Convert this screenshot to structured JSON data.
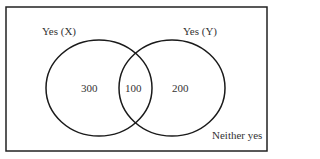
{
  "diagram": {
    "type": "venn",
    "sets": [
      {
        "label": "Yes (X)",
        "only_value": "300"
      },
      {
        "label": "Yes (Y)",
        "only_value": "200"
      }
    ],
    "intersection_value": "100",
    "outside_label": "Neither yes",
    "colors": {
      "stroke": "#1a1a1a",
      "text": "#333333",
      "background": "#ffffff"
    }
  }
}
